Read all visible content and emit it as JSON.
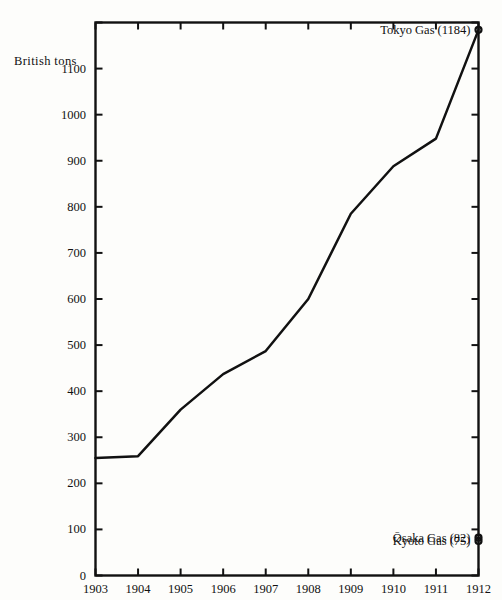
{
  "chart_data": {
    "type": "line",
    "title": "",
    "subtitle": "",
    "xlabel": "",
    "ylabel": "British tons",
    "xlim": [
      1903,
      1912
    ],
    "ylim": [
      0,
      1200
    ],
    "grid": false,
    "legend_position": "none",
    "x": [
      1903,
      1904,
      1905,
      1906,
      1907,
      1908,
      1909,
      1910,
      1911,
      1912
    ],
    "xtick_labels": [
      "1903",
      "1904",
      "1905",
      "1906",
      "1907",
      "1908",
      "1909",
      "1910",
      "1911",
      "1912"
    ],
    "ytick_values": [
      0,
      100,
      200,
      300,
      400,
      500,
      600,
      700,
      800,
      900,
      1000,
      1100,
      1200
    ],
    "ytick_labels": [
      "0",
      "100",
      "200",
      "300",
      "400",
      "500",
      "600",
      "700",
      "800",
      "900",
      "1000",
      "1100",
      ""
    ],
    "series": [
      {
        "name": "Tokyo Gas",
        "values": [
          255,
          259,
          360,
          437,
          487,
          600,
          785,
          888,
          948,
          1184
        ],
        "marker": "open-circle-endpoint"
      }
    ],
    "endpoint_markers": [
      {
        "label": "Tokyo Gas (1184)",
        "name": "Tokyo Gas",
        "value": 1184,
        "year": 1912
      },
      {
        "label": "Ōsaka Gas (82)",
        "name": "Ōsaka Gas",
        "value": 82,
        "year": 1912
      },
      {
        "label": "Kyoto Gas (75)",
        "name": "Kyoto Gas",
        "value": 75,
        "year": 1912
      }
    ],
    "colors": {
      "line": "#111111",
      "axis": "#111111",
      "background": "#fdfdfb",
      "text": "#111111"
    }
  }
}
